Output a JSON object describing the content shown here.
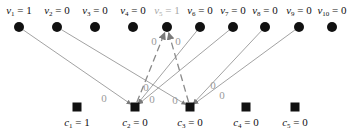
{
  "colors": {
    "node": "#111111",
    "edge": "#8a8a8a",
    "highlighted_label": "#a8a8a8",
    "edge_label": "#9a9a9a"
  },
  "variable_nodes": [
    {
      "id": "v1",
      "name": "v",
      "sub": "1",
      "value": "1",
      "x": 19,
      "y": 27
    },
    {
      "id": "v2",
      "name": "v",
      "sub": "2",
      "value": "0",
      "x": 57,
      "y": 27
    },
    {
      "id": "v3",
      "name": "v",
      "sub": "3",
      "value": "0",
      "x": 95,
      "y": 27
    },
    {
      "id": "v4",
      "name": "v",
      "sub": "4",
      "value": "0",
      "x": 133,
      "y": 27
    },
    {
      "id": "v5",
      "name": "v",
      "sub": "5",
      "value": "1",
      "x": 167,
      "y": 27,
      "highlighted": true
    },
    {
      "id": "v6",
      "name": "v",
      "sub": "6",
      "value": "0",
      "x": 200,
      "y": 27
    },
    {
      "id": "v7",
      "name": "v",
      "sub": "7",
      "value": "0",
      "x": 233,
      "y": 27
    },
    {
      "id": "v8",
      "name": "v",
      "sub": "8",
      "value": "0",
      "x": 265,
      "y": 27
    },
    {
      "id": "v9",
      "name": "v",
      "sub": "9",
      "value": "0",
      "x": 299,
      "y": 27
    },
    {
      "id": "v10",
      "name": "v",
      "sub": "10",
      "value": "0",
      "x": 332,
      "y": 27
    }
  ],
  "check_nodes": [
    {
      "id": "c1",
      "name": "c",
      "sub": "1",
      "value": "1",
      "x": 77,
      "y": 107
    },
    {
      "id": "c2",
      "name": "c",
      "sub": "2",
      "value": "0",
      "x": 135,
      "y": 107
    },
    {
      "id": "c3",
      "name": "c",
      "sub": "3",
      "value": "0",
      "x": 190,
      "y": 107
    },
    {
      "id": "c4",
      "name": "c",
      "sub": "4",
      "value": "0",
      "x": 246,
      "y": 107
    },
    {
      "id": "c5",
      "name": "c",
      "sub": "5",
      "value": "0",
      "x": 295,
      "y": 107
    }
  ],
  "edges": [
    {
      "from": "v1",
      "to": "c2",
      "style": "solid",
      "label": "0",
      "lx": 104,
      "ly": 102
    },
    {
      "from": "v2",
      "to": "c3",
      "style": "solid",
      "label": "0",
      "lx": 175,
      "ly": 104
    },
    {
      "from": "v6",
      "to": "c2",
      "style": "solid",
      "label": "0",
      "lx": 146,
      "ly": 91
    },
    {
      "from": "v7",
      "to": "c2",
      "style": "solid",
      "label": "0",
      "lx": 152,
      "ly": 103
    },
    {
      "from": "v8",
      "to": "c3",
      "style": "solid",
      "label": "0",
      "lx": 213,
      "ly": 89
    },
    {
      "from": "v9",
      "to": "c3",
      "style": "solid",
      "label": "0",
      "lx": 222,
      "ly": 99
    },
    {
      "from": "c2",
      "to": "v5",
      "style": "dashed",
      "label": "0",
      "lx": 154,
      "ly": 45
    },
    {
      "from": "c3",
      "to": "v5",
      "style": "dashed",
      "label": "0",
      "lx": 178,
      "ly": 45
    }
  ],
  "edge_labels": [
    "0",
    "0",
    "0",
    "0",
    "0",
    "0",
    "0",
    "0"
  ]
}
